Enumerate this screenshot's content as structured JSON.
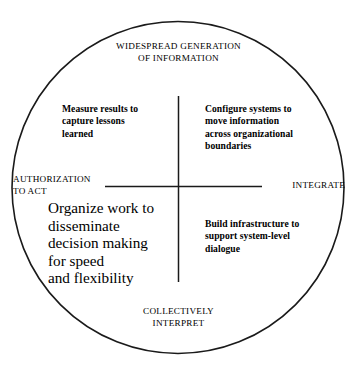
{
  "diagram": {
    "shape": "circle",
    "stroke_color": "#1a1a1a",
    "background_color": "#ffffff",
    "text_color": "#000000",
    "poles": {
      "top": "WIDESPREAD GENERATION\nOF INFORMATION",
      "bottom": "COLLECTIVELY\nINTERPRET",
      "left": "AUTHORIZATION\nTO ACT",
      "right": "INTEGRATE"
    },
    "quadrants": {
      "top_left": "Measure results to\ncapture lessons\nlearned",
      "top_right": "Configure systems to\nmove information\nacross organizational\nboundaries",
      "bottom_left": "Organize work to\ndisseminate\ndecision making\nfor speed\nand flexibility",
      "bottom_right": "Build infrastructure to\nsupport system-level\ndialogue"
    }
  }
}
